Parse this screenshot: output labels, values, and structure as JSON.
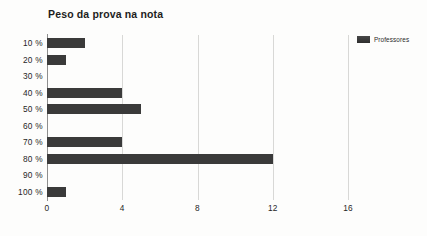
{
  "chart_data": {
    "type": "bar",
    "orientation": "horizontal",
    "title": "Peso da prova na nota",
    "xlabel": "",
    "ylabel": "",
    "categories": [
      "10 %",
      "20 %",
      "30 %",
      "40 %",
      "50 %",
      "60 %",
      "70 %",
      "80 %",
      "90 %",
      "100 %"
    ],
    "series": [
      {
        "name": "Professores",
        "values": [
          2,
          1,
          0,
          4,
          5,
          0,
          4,
          12,
          0,
          1
        ],
        "color": "#3a3a3a"
      }
    ],
    "xlim": [
      0,
      16
    ],
    "xticks": [
      0,
      4,
      8,
      12,
      16
    ],
    "xtick_labels": [
      "0",
      "4",
      "8",
      "12",
      "16"
    ],
    "grid": "vertical",
    "legend_position": "top-right",
    "legend_entries": [
      "Professores"
    ]
  },
  "legend": {
    "swatch_name": "legend-swatch-professores",
    "label": "Professores"
  }
}
